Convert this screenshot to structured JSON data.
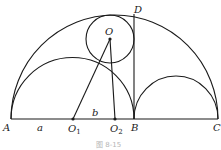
{
  "figure": {
    "caption": "图 8-15",
    "points": {
      "A": {
        "label": "A",
        "x": 11,
        "y": 119
      },
      "O1": {
        "label": "O",
        "sub": "1",
        "x": 73,
        "y": 119
      },
      "O2": {
        "label": "O",
        "sub": "2",
        "x": 115,
        "y": 119
      },
      "B": {
        "label": "B",
        "x": 134,
        "y": 119
      },
      "C": {
        "label": "C",
        "x": 218,
        "y": 119
      },
      "O": {
        "label": "O",
        "x": 110,
        "y": 39
      },
      "D": {
        "label": "D",
        "x": 134,
        "y": 14
      }
    },
    "segment_labels": {
      "a": "a",
      "b": "b"
    },
    "shapes": [
      {
        "type": "semicircle",
        "name": "large",
        "from": "A",
        "to": "C"
      },
      {
        "type": "semicircle",
        "name": "left",
        "from": "A",
        "to": "B",
        "center": "O1"
      },
      {
        "type": "semicircle",
        "name": "right",
        "from": "B",
        "to": "C"
      },
      {
        "type": "circle",
        "name": "inscribed",
        "center": "O"
      },
      {
        "type": "segment",
        "from": "B",
        "to": "D"
      },
      {
        "type": "segment",
        "from": "O",
        "to": "O1"
      },
      {
        "type": "segment",
        "from": "O",
        "to": "O2"
      },
      {
        "type": "segment",
        "from": "A",
        "to": "C"
      }
    ]
  }
}
